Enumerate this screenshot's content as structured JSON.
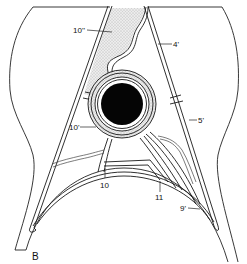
{
  "figure": {
    "panel_label": "B",
    "labels": [
      {
        "id": "label-10dblprime",
        "text": "10''",
        "x": 73,
        "y": 27
      },
      {
        "id": "label-4prime",
        "text": "4'",
        "x": 173,
        "y": 41
      },
      {
        "id": "label-10prime",
        "text": "10'",
        "x": 69,
        "y": 124
      },
      {
        "id": "label-5prime",
        "text": "5'",
        "x": 198,
        "y": 117
      },
      {
        "id": "label-10",
        "text": "10",
        "x": 100,
        "y": 182
      },
      {
        "id": "label-11",
        "text": "11",
        "x": 155,
        "y": 194
      },
      {
        "id": "label-9prime",
        "text": "9'",
        "x": 180,
        "y": 205
      }
    ],
    "colors": {
      "line": "#1a1a1a",
      "fill_dark": "#050505",
      "stipple": "#d8d8d8",
      "background": "#ffffff"
    }
  }
}
